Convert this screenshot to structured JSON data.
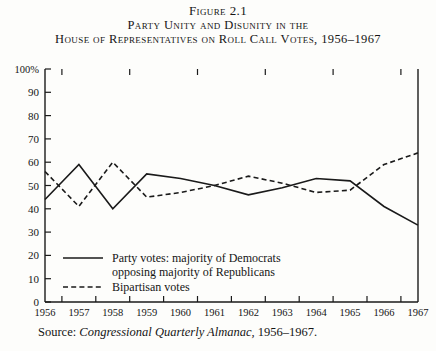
{
  "figure": {
    "number_line": "Figure 2.1",
    "title_line_1": "Party Unity and Disunity in the",
    "title_line_2": "House of Representatives on Roll Call Votes, 1956–1967"
  },
  "source": {
    "prefix": "Source: ",
    "italic_part": "Congressional Quarterly Almanac,",
    "suffix": " 1956–1967."
  },
  "axes": {
    "y_top_label": "100%",
    "y_tick_labels": [
      "0",
      "10",
      "20",
      "30",
      "40",
      "50",
      "60",
      "70",
      "80",
      "90",
      "100%"
    ],
    "x_tick_labels": [
      "1956",
      "1957",
      "1958",
      "1959",
      "1960",
      "1961",
      "1962",
      "1963",
      "1964",
      "1965",
      "1966",
      "1967"
    ]
  },
  "legend": {
    "items": [
      {
        "style": "solid",
        "label_line_1": "Party votes: majority of Democrats",
        "label_line_2": "opposing majority of Republicans"
      },
      {
        "style": "dashed",
        "label_line_1": "Bipartisan votes",
        "label_line_2": ""
      }
    ]
  },
  "chart_data": {
    "type": "line",
    "title": "Party Unity and Disunity in the House of Representatives on Roll Call Votes, 1956–1967",
    "xlabel": "",
    "ylabel": "",
    "ylim": [
      0,
      100
    ],
    "ytick_step": 10,
    "grid": false,
    "legend_position": "inside-lower-left",
    "categories": [
      "1956",
      "1957",
      "1958",
      "1959",
      "1960",
      "1961",
      "1962",
      "1963",
      "1964",
      "1965",
      "1966",
      "1967"
    ],
    "series": [
      {
        "name": "Party votes: majority of Democrats opposing majority of Republicans",
        "style": "solid",
        "color": "#1a1a1a",
        "values": [
          44,
          59,
          40,
          55,
          53,
          50,
          46,
          49,
          53,
          52,
          41,
          33
        ]
      },
      {
        "name": "Bipartisan votes",
        "style": "dashed",
        "color": "#1a1a1a",
        "values": [
          56,
          41,
          60,
          45,
          47,
          50,
          54,
          51,
          47,
          48,
          59,
          64
        ]
      }
    ]
  },
  "colors": {
    "ink": "#1a1a1a",
    "paper": "#fdfdfb"
  }
}
